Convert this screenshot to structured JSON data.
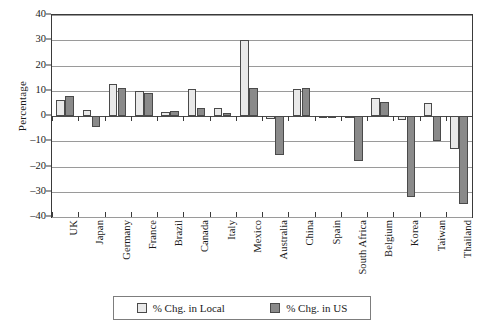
{
  "chart_data": {
    "type": "bar",
    "title": "",
    "xlabel": "",
    "ylabel": "Percentage",
    "ylim": [
      -40,
      40
    ],
    "yticks": [
      40,
      30,
      20,
      10,
      0,
      -10,
      -20,
      -30,
      -40
    ],
    "ytick_labels": [
      "40",
      "30",
      "20",
      "10",
      "0",
      "–10",
      "–20",
      "–30",
      "–40"
    ],
    "grid": true,
    "legend_position": "bottom",
    "categories": [
      "UK",
      "Japan",
      "Germany",
      "France",
      "Brazil",
      "Canada",
      "Italy",
      "Mexico",
      "Australia",
      "China",
      "Spain",
      "South Africa",
      "Belgium",
      "Korea",
      "Taiwan",
      "Thailand"
    ],
    "series": [
      {
        "name": "% Chg. in Local",
        "color": "#e9e9e9",
        "values": [
          6.5,
          2.5,
          12.7,
          9.8,
          1.7,
          10.5,
          3.0,
          30.0,
          -1.0,
          10.8,
          -0.4,
          -0.8,
          7.0,
          -1.5,
          5.0,
          -13.0
        ]
      },
      {
        "name": "% Chg. in US",
        "color": "#8a8a8a",
        "values": [
          8.0,
          -4.5,
          11.1,
          9.0,
          1.8,
          3.3,
          1.0,
          11.2,
          -15.5,
          11.0,
          -0.6,
          -18.0,
          5.5,
          -32.0,
          -10.0,
          -35.0
        ]
      }
    ]
  },
  "legend": {
    "items": [
      {
        "label": "% Chg. in Local",
        "swatch": "local"
      },
      {
        "label": "% Chg. in US",
        "swatch": "us"
      }
    ]
  }
}
